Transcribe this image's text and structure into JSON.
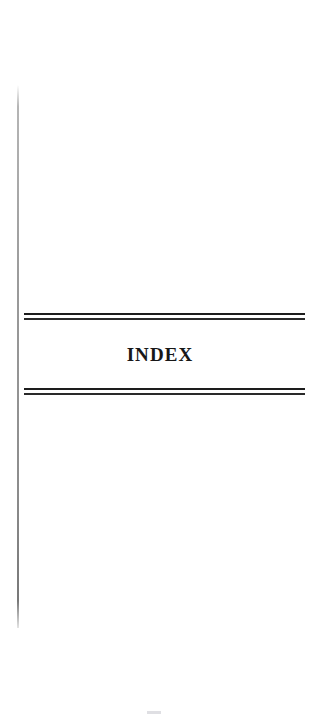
{
  "page": {
    "kind": "scanned-book-page",
    "background_color": "#ffffff",
    "width": 313,
    "height": 718
  },
  "heading": {
    "text": "INDEX",
    "color": "#171717"
  },
  "rules": {
    "top": {
      "name": "double-rule-above-heading",
      "color": "#1d1d1d"
    },
    "bottom": {
      "name": "double-rule-below-heading",
      "color": "#1d1d1d"
    }
  },
  "gutter": {
    "name": "binding-shadow-line",
    "color": "#8c8c8c"
  },
  "artifact": {
    "name": "scan-smudge",
    "color": "#afafb9"
  }
}
